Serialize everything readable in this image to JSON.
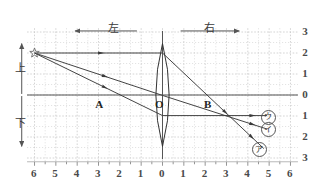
{
  "figure": {
    "direction_labels": {
      "left": "左",
      "right": "右"
    },
    "vertical_labels": {
      "up": "上",
      "down": "下"
    },
    "point_labels": {
      "a": "A",
      "o": "O",
      "b": "B"
    },
    "object_marker": "star",
    "options": [
      {
        "id": "u",
        "label": "ウ",
        "x": 4.9,
        "y": -1.0
      },
      {
        "id": "i",
        "label": "イ",
        "x": 4.9,
        "y": -1.6
      },
      {
        "id": "a",
        "label": "ア",
        "x": 4.5,
        "y": -2.55
      }
    ],
    "colors": {
      "grid": "#c9c9c9",
      "axis": "#555555",
      "ray": "#3a3a3a",
      "lens": "#333333",
      "text": "#3a3a3a"
    }
  },
  "chart_data": {
    "type": "line",
    "xlabel": "",
    "ylabel": "",
    "xlim": [
      -6.5,
      6.5
    ],
    "ylim": [
      -3.2,
      3.2
    ],
    "grid": true,
    "legend": "none",
    "x_tick_labels": [
      "6",
      "5",
      "4",
      "3",
      "2",
      "1",
      "0",
      "1",
      "2",
      "3",
      "4",
      "5",
      "6"
    ],
    "x_tick_values": [
      -6,
      -5,
      -4,
      -3,
      -2,
      -1,
      0,
      1,
      2,
      3,
      4,
      5,
      6
    ],
    "y_tick_labels": [
      "3",
      "2",
      "1",
      "0",
      "1",
      "2",
      "3"
    ],
    "y_tick_values": [
      3,
      2,
      1,
      0,
      -1,
      -2,
      -3
    ],
    "annotations": [
      {
        "text": "左",
        "x": -2.4,
        "y": 3.35
      },
      {
        "text": "右",
        "x": 2.1,
        "y": 3.35
      },
      {
        "text": "上",
        "x": -6.9,
        "y": 1.4
      },
      {
        "text": "下",
        "x": -6.9,
        "y": -1.4
      },
      {
        "text": "A",
        "x": -3.05,
        "y": -0.28
      },
      {
        "text": "O",
        "x": -0.3,
        "y": -0.28
      },
      {
        "text": "B",
        "x": 2.1,
        "y": -0.28
      },
      {
        "text": "ウ",
        "x": 4.9,
        "y": -1.0
      },
      {
        "text": "イ",
        "x": 4.9,
        "y": -1.6
      },
      {
        "text": "ア",
        "x": 4.5,
        "y": -2.55
      }
    ],
    "object_point": {
      "x": -6,
      "y": 2
    },
    "lens": {
      "center_x": 0,
      "half_height": 2.45,
      "half_width": 0.62,
      "type": "biconvex"
    },
    "series": [
      {
        "name": "ray-horizontal-incident",
        "x": [
          -6,
          0
        ],
        "y": [
          2,
          2
        ]
      },
      {
        "name": "ray-horizontal-refracted",
        "x": [
          0,
          4.75
        ],
        "y": [
          2,
          -2.55
        ]
      },
      {
        "name": "ray-through-center-incident",
        "x": [
          -6,
          0
        ],
        "y": [
          2,
          -0.02
        ]
      },
      {
        "name": "ray-through-center-refracted",
        "x": [
          0,
          4.9
        ],
        "y": [
          -0.02,
          -1.62
        ]
      },
      {
        "name": "ray-lower-incident",
        "x": [
          -6,
          0
        ],
        "y": [
          2,
          -0.98
        ]
      },
      {
        "name": "ray-lower-refracted",
        "x": [
          0,
          4.9
        ],
        "y": [
          -0.98,
          -0.98
        ]
      },
      {
        "name": "direction-arrow-left",
        "x": [
          -1.2,
          -4.1
        ],
        "y": [
          3.05,
          3.05
        ]
      },
      {
        "name": "direction-arrow-right",
        "x": [
          0.85,
          3.6
        ],
        "y": [
          3.05,
          3.05
        ]
      },
      {
        "name": "vertical-arrow-up",
        "x": [
          -6.6,
          -6.6
        ],
        "y": [
          0.05,
          2.45
        ]
      },
      {
        "name": "vertical-arrow-down",
        "x": [
          -6.6,
          -6.6
        ],
        "y": [
          -0.05,
          -2.45
        ]
      }
    ]
  }
}
